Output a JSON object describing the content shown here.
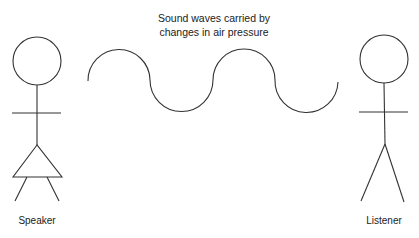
{
  "caption": {
    "line1": "Sound waves carried by",
    "line2": "changes in air pressure"
  },
  "figures": {
    "speaker": {
      "label": "Speaker"
    },
    "listener": {
      "label": "Listener"
    }
  },
  "wave": {
    "cycles": 2,
    "color": "#333333"
  },
  "colors": {
    "stroke": "#333333",
    "background": "#ffffff",
    "text": "#222222"
  }
}
